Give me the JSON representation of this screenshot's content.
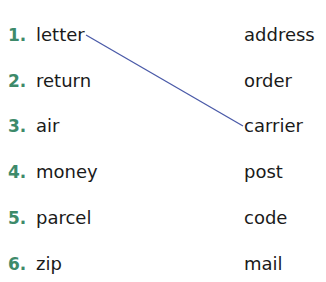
{
  "exercise": {
    "number_color": "#3d8a6a",
    "line_color": "#4a5aa8",
    "left_items": [
      {
        "num": "1.",
        "word": "letter"
      },
      {
        "num": "2.",
        "word": "return"
      },
      {
        "num": "3.",
        "word": "air"
      },
      {
        "num": "4.",
        "word": "money"
      },
      {
        "num": "5.",
        "word": "parcel"
      },
      {
        "num": "6.",
        "word": "zip"
      }
    ],
    "right_items": [
      "address",
      "order",
      "carrier",
      "post",
      "code",
      "mail"
    ],
    "connections": [
      {
        "from": "letter",
        "to": "carrier"
      }
    ]
  }
}
